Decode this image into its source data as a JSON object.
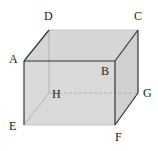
{
  "diagram": {
    "type": "cuboid",
    "colors": {
      "face_fill": "#d6d6d6",
      "edge_visible": "#333333",
      "edge_hidden": "#9a9a9a",
      "background": "#ffffff",
      "label": "#222222"
    },
    "vertices": {
      "A": {
        "label": "A",
        "x": 24,
        "y": 61
      },
      "B": {
        "label": "B",
        "x": 115,
        "y": 61
      },
      "C": {
        "label": "C",
        "x": 138,
        "y": 30
      },
      "D": {
        "label": "D",
        "x": 49,
        "y": 30
      },
      "E": {
        "label": "E",
        "x": 24,
        "y": 125
      },
      "F": {
        "label": "F",
        "x": 115,
        "y": 125
      },
      "G": {
        "label": "G",
        "x": 138,
        "y": 93
      },
      "H": {
        "label": "H",
        "x": 49,
        "y": 93
      }
    },
    "labels": [
      {
        "id": "A",
        "text": "A",
        "x": 9,
        "y": 63
      },
      {
        "id": "B",
        "text": "B",
        "x": 101,
        "y": 75
      },
      {
        "id": "C",
        "text": "C",
        "x": 136,
        "y": 20
      },
      {
        "id": "D",
        "text": "D",
        "x": 44,
        "y": 20
      },
      {
        "id": "E",
        "text": "E",
        "x": 9,
        "y": 130
      },
      {
        "id": "F",
        "text": "F",
        "x": 115,
        "y": 141
      },
      {
        "id": "G",
        "text": "G",
        "x": 143,
        "y": 97
      },
      {
        "id": "H",
        "text": "H",
        "x": 52,
        "y": 98
      }
    ],
    "edges_visible": [
      "AB",
      "BC",
      "CD",
      "DA",
      "AE",
      "EF",
      "FB",
      "FG",
      "GC"
    ],
    "edges_hidden": [
      "DH",
      "HE",
      "HG"
    ]
  }
}
